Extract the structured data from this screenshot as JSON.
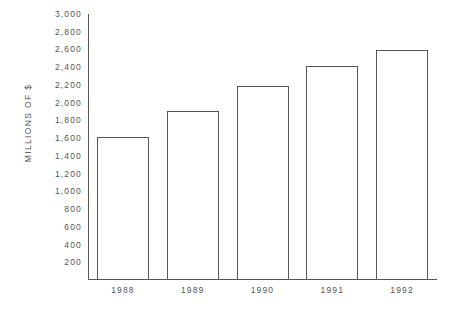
{
  "chart_data": {
    "type": "bar",
    "title": "",
    "xlabel": "",
    "ylabel": "MILLIONS OF $",
    "categories": [
      "1988",
      "1989",
      "1990",
      "1991",
      "1992"
    ],
    "values": [
      1600,
      1900,
      2180,
      2400,
      2580
    ],
    "series": [
      {
        "name": "",
        "values": [
          1600,
          1900,
          2180,
          2400,
          2580
        ]
      }
    ],
    "ylim": [
      0,
      3000
    ],
    "xlim": [
      0,
      5
    ],
    "y_tick_labels": [
      "3,000",
      "2,800",
      "2,600",
      "2,400",
      "2,200",
      "2,000",
      "1,800",
      "1,600",
      "1,400",
      "1,200",
      "1,000",
      "800",
      "600",
      "400",
      "200"
    ],
    "y_tick_values": [
      3000,
      2800,
      2600,
      2400,
      2200,
      2000,
      1800,
      1600,
      1400,
      1200,
      1000,
      800,
      600,
      400,
      200
    ],
    "x_tick_labels": [
      "1988",
      "1989",
      "1990",
      "1991",
      "1992"
    ],
    "grid": false,
    "legend": null,
    "annotations": [],
    "bar_fill_color": "#ffffff",
    "bar_edge_color": "#555555",
    "axis_color": "#555555",
    "background_color": "#ffffff",
    "text_color": "#555555"
  }
}
